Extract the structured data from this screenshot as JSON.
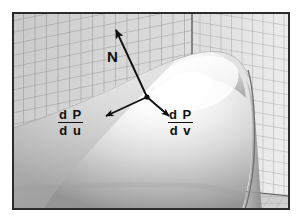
{
  "figure": {
    "frame": {
      "border_color": "#2b2b2b",
      "background_color": "#ffffff",
      "x": 12,
      "y": 12,
      "width": 278,
      "height": 198
    },
    "colors": {
      "grid_line": "#8e8e8e",
      "wall_left": "#d2d2d2",
      "wall_right": "#e2e2e2",
      "floor": "#bdbdbd",
      "surface_highlight": "#fdfdfd",
      "surface_shadow": "#8a8a8a",
      "vector_stroke": "#101010",
      "label_text": "#101010",
      "corner_line": "#3a3a3a"
    },
    "annotations": [
      {
        "id": "normal-vector",
        "label": "N",
        "type": "vector",
        "origin": [
          147,
          97
        ],
        "tip": [
          114,
          27
        ],
        "label_position": [
          107,
          48
        ]
      },
      {
        "id": "tangent-u-vector",
        "label_numerator": "d P",
        "label_denominator": "d u",
        "type": "vector",
        "origin": [
          147,
          97
        ],
        "tip": [
          103,
          117
        ],
        "label_position": [
          58,
          108
        ]
      },
      {
        "id": "tangent-v-vector",
        "label_numerator": "d P",
        "label_denominator": "d v",
        "type": "vector",
        "origin": [
          147,
          97
        ],
        "tip": [
          170,
          117
        ],
        "label_position": [
          168,
          108
        ]
      }
    ],
    "labels": {
      "normal": "N",
      "tangent_u_num": "d P",
      "tangent_u_den": "d u",
      "tangent_v_num": "d P",
      "tangent_v_den": "d v"
    },
    "surface": {
      "name": "parametric-surface-blob",
      "description": "smooth shaded bump rising from lower-left to a rounded crest at upper-right"
    },
    "background": {
      "name": "perspective-grid-walls",
      "corner_x": 192,
      "grid_spacing_px": 11
    }
  }
}
